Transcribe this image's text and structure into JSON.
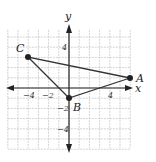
{
  "diagram": {
    "type": "coordinate-plane-triangle",
    "axes": {
      "x_label": "x",
      "y_label": "y",
      "x_range": [
        -6,
        6
      ],
      "y_range": [
        -5,
        5
      ],
      "grid": true,
      "x_ticks": [
        {
          "value": -4,
          "label": "−4"
        },
        {
          "value": -2,
          "label": "−2"
        },
        {
          "value": 4,
          "label": "4"
        }
      ],
      "y_ticks": [
        {
          "value": 4,
          "label": "4"
        },
        {
          "value": -2,
          "label": "−2"
        },
        {
          "value": -4,
          "label": "−4"
        }
      ]
    },
    "points": [
      {
        "name": "A",
        "x": 6,
        "y": 1
      },
      {
        "name": "B",
        "x": 0,
        "y": -1
      },
      {
        "name": "C",
        "x": -4,
        "y": 3
      }
    ],
    "colors": {
      "line": "#333333",
      "grid": "#c8c8c8",
      "axis": "#222222"
    }
  }
}
